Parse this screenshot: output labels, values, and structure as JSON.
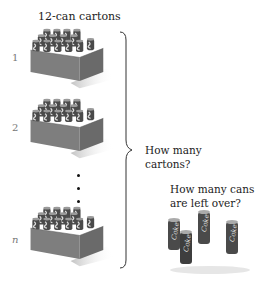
{
  "title": "12-can cartons",
  "rows": [
    {
      "label": "1"
    },
    {
      "label": "2"
    },
    {
      "label": "n"
    }
  ],
  "questions": {
    "cartons_line1": "How many",
    "cartons_line2": "cartons?",
    "cans_line1": "How many cans",
    "cans_line2": "are left over?"
  },
  "icons": {
    "carton": "12-can-carton-image",
    "loose_cans": "4-loose-cola-cans-image",
    "brace": "right-curly-brace"
  },
  "colors": {
    "box": "#7a7a7a",
    "box_dark": "#5e5e5e",
    "can": "#4a4a4a",
    "can_highlight": "#d8d8d8"
  }
}
